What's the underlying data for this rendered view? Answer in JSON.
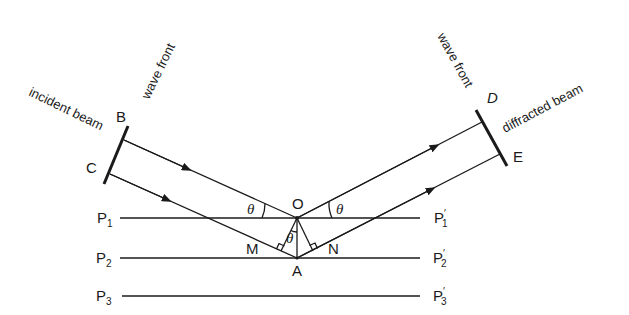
{
  "diagram": {
    "type": "bragg-diffraction-geometry",
    "labels": {
      "incident_beam": "incident beam",
      "diffracted_beam": "diffracted beam",
      "wave_front_left": "wave front",
      "wave_front_right": "wave front",
      "B": "B",
      "C": "C",
      "D": "D",
      "E": "E",
      "O": "O",
      "A": "A",
      "M": "M",
      "N": "N",
      "theta": "θ"
    },
    "planes": [
      {
        "left": "P",
        "left_sub": "1",
        "right": "P",
        "right_sub": "1",
        "right_prime": "′"
      },
      {
        "left": "P",
        "left_sub": "2",
        "right": "P",
        "right_sub": "2",
        "right_prime": "′"
      },
      {
        "left": "P",
        "left_sub": "3",
        "right": "P",
        "right_sub": "3",
        "right_prime": "′"
      }
    ],
    "colors": {
      "line": "#1a1a1a",
      "background": "#ffffff"
    }
  }
}
